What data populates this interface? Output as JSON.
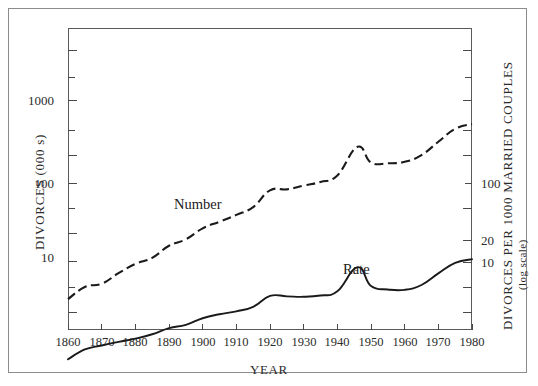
{
  "chart_data": {
    "type": "line",
    "title": "",
    "xlabel": "YEAR",
    "ylabel_left": "DIVORCES (000 s)",
    "ylabel_right": "DIVORCES PER 1000 MARRIED COUPLES",
    "ylabel_right_sub": "(log scale)",
    "xlim": [
      1860,
      1980
    ],
    "xticks": [
      1860,
      1870,
      1880,
      1890,
      1900,
      1910,
      1920,
      1930,
      1940,
      1950,
      1960,
      1970,
      1980
    ],
    "xticklabels": [
      "1860",
      "1870",
      "1880",
      "1890",
      "1900",
      "1910",
      "1920",
      "1930",
      "1940",
      "1950",
      "1960",
      "1970",
      "1980"
    ],
    "yscale": "log",
    "ylim_left": [
      1.5,
      4000
    ],
    "yticks_left": [
      1,
      10,
      100,
      1000
    ],
    "yticklabels_left": [
      "",
      "10",
      "100",
      "1000"
    ],
    "yticks_right": [
      10,
      20,
      100
    ],
    "yticklabels_right": [
      "10",
      "20",
      "100"
    ],
    "grid": false,
    "legend": "inline-annotations",
    "series": [
      {
        "name": "Number",
        "style": "dashed",
        "axis": "left",
        "units": "thousands of divorces",
        "x": [
          1860,
          1865,
          1870,
          1875,
          1880,
          1885,
          1890,
          1895,
          1900,
          1905,
          1910,
          1915,
          1920,
          1925,
          1930,
          1935,
          1940,
          1946,
          1950,
          1955,
          1960,
          1965,
          1970,
          1975,
          1980
        ],
        "values": [
          7.0,
          10.0,
          11.0,
          15.0,
          19.7,
          23.5,
          33.5,
          40.5,
          55.8,
          67.9,
          83.0,
          104.3,
          170.5,
          175.4,
          195.9,
          218.0,
          264.0,
          610.0,
          385.1,
          377.0,
          393.0,
          479.0,
          708.0,
          1036.0,
          1189.0
        ]
      },
      {
        "name": "Rate",
        "style": "solid",
        "axis": "right",
        "units": "divorces per 1000 married couples",
        "x": [
          1860,
          1865,
          1870,
          1875,
          1880,
          1885,
          1890,
          1895,
          1900,
          1905,
          1910,
          1915,
          1920,
          1925,
          1930,
          1935,
          1940,
          1946,
          1950,
          1955,
          1960,
          1965,
          1970,
          1975,
          1980
        ],
        "values": [
          1.2,
          1.6,
          1.8,
          2.0,
          2.2,
          2.5,
          3.0,
          3.3,
          4.0,
          4.5,
          4.9,
          5.6,
          7.7,
          7.6,
          7.5,
          7.8,
          8.8,
          17.9,
          10.3,
          9.3,
          9.2,
          10.6,
          14.9,
          20.3,
          22.6
        ]
      }
    ],
    "annotations": [
      {
        "text": "Number",
        "x": 1914,
        "y_left": 150
      },
      {
        "text": "Rate",
        "x": 1955,
        "y_right": 17
      }
    ]
  },
  "axes": {
    "left_ticks": [
      {
        "label": "1000",
        "major": true
      },
      {
        "label": "100",
        "major": true
      },
      {
        "label": "10",
        "major": true
      }
    ],
    "right_ticks": [
      {
        "label": "100"
      },
      {
        "label": "20"
      },
      {
        "label": "10"
      }
    ]
  }
}
